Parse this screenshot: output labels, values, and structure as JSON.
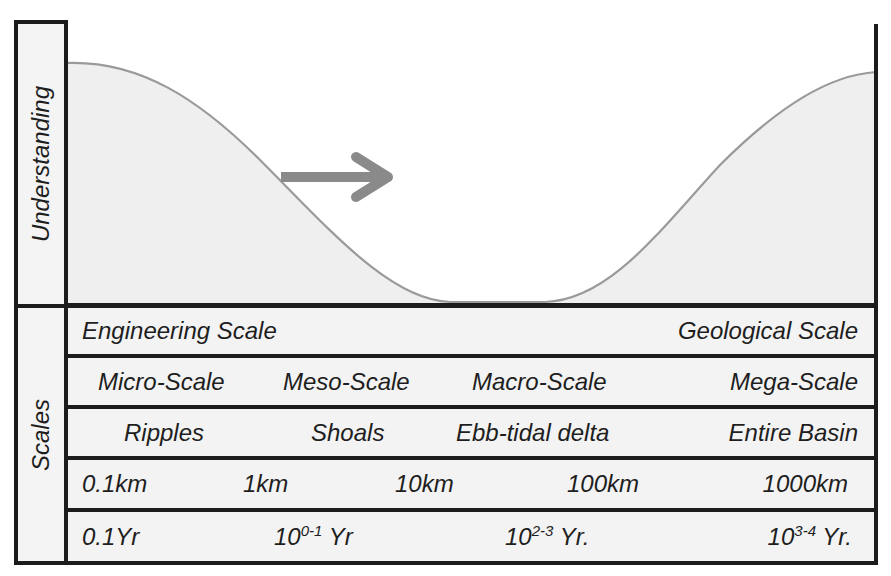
{
  "understanding_panel": {
    "label": "Understanding",
    "arrow_direction": "right",
    "curve_description": "high at engineering scale, dips to minimum at meso/macro scale, rises again at geological scale",
    "colors": {
      "curve_fill": "#efefef",
      "curve_stroke": "#9a9a9a",
      "arrow": "#8a8a8a",
      "border": "#1c1c1c"
    }
  },
  "scales_panel": {
    "label": "Scales",
    "rows": [
      {
        "name": "scale-domain",
        "cells": [
          "Engineering Scale",
          "Geological Scale"
        ]
      },
      {
        "name": "scale-class",
        "cells": [
          "Micro-Scale",
          "Meso-Scale",
          "Macro-Scale",
          "Mega-Scale"
        ]
      },
      {
        "name": "morphology",
        "cells": [
          "Ripples",
          "Shoals",
          "Ebb-tidal delta",
          "Entire Basin"
        ]
      },
      {
        "name": "spatial",
        "cells": [
          "0.1km",
          "1km",
          "10km",
          "100km",
          "1000km"
        ]
      },
      {
        "name": "temporal",
        "cells": [
          {
            "base": "0.1Yr",
            "sup": "",
            "suffix": ""
          },
          {
            "base": "10",
            "sup": "0-1",
            "suffix": " Yr"
          },
          {
            "base": "10",
            "sup": "2-3",
            "suffix": " Yr."
          },
          {
            "base": "10",
            "sup": "3-4",
            "suffix": " Yr."
          }
        ]
      }
    ]
  }
}
